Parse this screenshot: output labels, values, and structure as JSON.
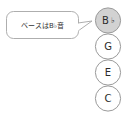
{
  "canvas": {
    "width": 127,
    "height": 121,
    "background": "#ffffff"
  },
  "colors": {
    "stroke": "#9a9a9a",
    "highlight_fill": "#d2d2d2",
    "plain_fill": "#ffffff",
    "text": "#2b2b2b",
    "bubble_stroke": "#a5a5a5",
    "bubble_fill": "#ffffff"
  },
  "callout": {
    "label": "ベースはB♭音",
    "tail_target": "note-bflat"
  },
  "chord_stack": {
    "title": "",
    "notes": [
      {
        "id": "note-bflat",
        "label": "B",
        "accidental": "♭",
        "highlighted": true
      },
      {
        "id": "note-g",
        "label": "G",
        "accidental": "",
        "highlighted": false
      },
      {
        "id": "note-e",
        "label": "E",
        "accidental": "",
        "highlighted": false
      },
      {
        "id": "note-c",
        "label": "C",
        "accidental": "",
        "highlighted": false
      }
    ]
  }
}
